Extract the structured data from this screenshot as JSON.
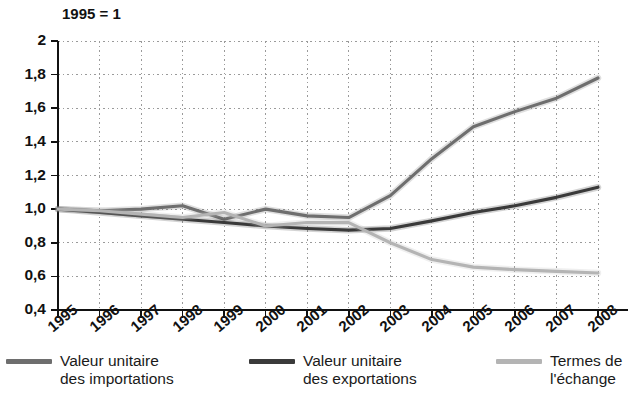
{
  "figure": {
    "title_fragment": "·",
    "index_note": "1995 = 1"
  },
  "chart_data": {
    "type": "line",
    "title": "1995 = 1",
    "subtitle": "",
    "xlabel": "",
    "ylabel": "",
    "grid": true,
    "legend_position": "bottom",
    "x": [
      1995,
      1996,
      1997,
      1998,
      1999,
      2000,
      2001,
      2002,
      2003,
      2004,
      2005,
      2006,
      2007,
      2008
    ],
    "categories": [
      "1995",
      "1996",
      "1997",
      "1998",
      "1999",
      "2000",
      "2001",
      "2002",
      "2003",
      "2004",
      "2005",
      "2006",
      "2007",
      "2008"
    ],
    "xlim": [
      1995,
      2008
    ],
    "ylim": [
      0.4,
      2.0
    ],
    "yticks": [
      0.4,
      0.6,
      0.8,
      1.0,
      1.2,
      1.4,
      1.6,
      1.8,
      2.0
    ],
    "ytick_labels": [
      "0,4",
      "0,6",
      "0,8",
      "1,0",
      "1,2",
      "1,4",
      "1,6",
      "1,8",
      "2"
    ],
    "series": [
      {
        "name": "Valeur unitaire\ndes importations",
        "legend_label": "Valeur unitaire\ndes importations",
        "color": "#6e6e6e",
        "values": [
          1.0,
          0.99,
          1.0,
          1.02,
          0.94,
          1.0,
          0.96,
          0.95,
          1.08,
          1.3,
          1.49,
          1.58,
          1.66,
          1.78
        ]
      },
      {
        "name": "Valeur unitaire\ndes exportations",
        "legend_label": "Valeur unitaire\ndes exportations",
        "color": "#3a3a3a",
        "values": [
          1.0,
          0.98,
          0.96,
          0.94,
          0.92,
          0.9,
          0.885,
          0.875,
          0.885,
          0.93,
          0.98,
          1.02,
          1.07,
          1.13
        ]
      },
      {
        "name": "Termes de\nl'échange",
        "legend_label": "Termes de\nl'échange",
        "color": "#b4b4b4",
        "values": [
          1.0,
          0.99,
          0.97,
          0.95,
          0.98,
          0.9,
          0.92,
          0.92,
          0.8,
          0.7,
          0.655,
          0.64,
          0.63,
          0.62
        ]
      }
    ]
  },
  "legend": {
    "items": [
      {
        "label": "Valeur unitaire\ndes importations",
        "color": "#6e6e6e"
      },
      {
        "label": "Valeur unitaire\ndes exportations",
        "color": "#3a3a3a"
      },
      {
        "label": "Termes de\nl'échange",
        "color": "#b4b4b4"
      }
    ]
  }
}
